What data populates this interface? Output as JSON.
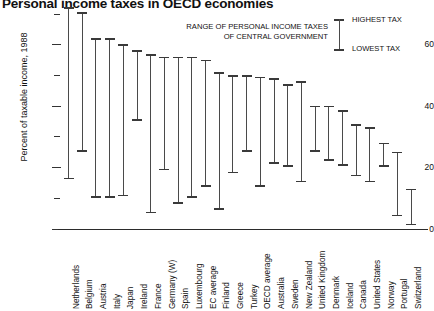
{
  "chart_data": {
    "type": "bar",
    "subtype": "range-high-low",
    "title": "Personal income taxes in OECD economies",
    "xlabel": "",
    "ylabel": "Percent of taxable income, 1988",
    "ylim": [
      0,
      72
    ],
    "yticks_major": [
      0,
      20,
      40,
      60
    ],
    "yticks_minor": [
      10,
      30,
      50,
      70
    ],
    "grid": false,
    "legend_position": "top-right",
    "legend": [
      {
        "label": "HIGHEST TAX"
      },
      {
        "label": "LOWEST TAX"
      }
    ],
    "annotation_lines": [
      "RANGE OF PERSONAL INCOME TAXES",
      "OF CENTRAL GOVERNMENT"
    ],
    "categories": [
      "Netherlands",
      "Belgium",
      "Austria",
      "Italy",
      "Japan",
      "Ireland",
      "France",
      "Germany (W)",
      "Spain",
      "Luxembourg",
      "EC average",
      "Finland",
      "Greece",
      "Turkey",
      "OECD average",
      "Australia",
      "Sweden",
      "New Zealand",
      "United Kingdom",
      "Denmark",
      "Iceland",
      "Canada",
      "United States",
      "Norway",
      "Portugal",
      "Switzerland"
    ],
    "series": [
      {
        "name": "HIGHEST TAX",
        "values": [
          72,
          70.5,
          62,
          62,
          60,
          58,
          56.8,
          56,
          56,
          56,
          55,
          51,
          50,
          50,
          49.5,
          49,
          47,
          48,
          40,
          40,
          38.5,
          34,
          33,
          28,
          25,
          13
        ]
      },
      {
        "name": "LOWEST TAX",
        "values": [
          16,
          25,
          10,
          10,
          10.5,
          35,
          5,
          19,
          8,
          10,
          13.5,
          6,
          18,
          25,
          13.5,
          21,
          20,
          15,
          25,
          22,
          20.5,
          17,
          15,
          20,
          4,
          1
        ]
      }
    ]
  }
}
